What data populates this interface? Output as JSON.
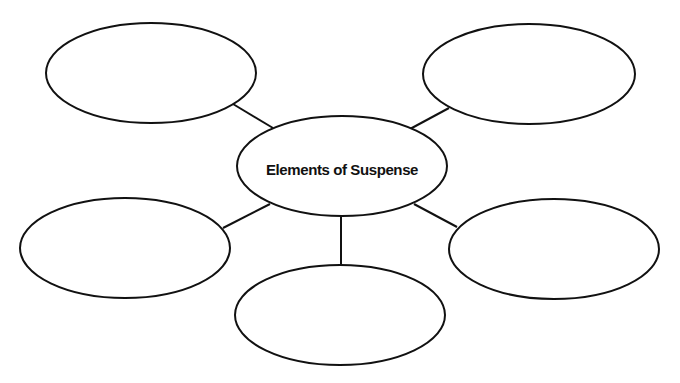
{
  "diagram": {
    "type": "web-organizer",
    "colors": {
      "background": "#ffffff",
      "stroke": "#111111",
      "text": "#111111"
    },
    "center": {
      "label": "Elements of Suspense",
      "cx": 342,
      "cy": 166,
      "rx": 105,
      "ry": 50
    },
    "nodes": [
      {
        "id": "top-left",
        "label": "",
        "cx": 151,
        "cy": 73,
        "rx": 105,
        "ry": 50
      },
      {
        "id": "top-right",
        "label": "",
        "cx": 529,
        "cy": 74,
        "rx": 106,
        "ry": 50
      },
      {
        "id": "middle-left",
        "label": "",
        "cx": 125,
        "cy": 248,
        "rx": 105,
        "ry": 50
      },
      {
        "id": "middle-right",
        "label": "",
        "cx": 554,
        "cy": 249,
        "rx": 105,
        "ry": 50
      },
      {
        "id": "bottom",
        "label": "",
        "cx": 340,
        "cy": 315,
        "rx": 105,
        "ry": 50
      }
    ],
    "connectors": [
      {
        "from": "center",
        "to": "top-left",
        "x1": 273,
        "y1": 128,
        "x2": 233,
        "y2": 104
      },
      {
        "from": "center",
        "to": "top-right",
        "x1": 410,
        "y1": 129,
        "x2": 449,
        "y2": 108
      },
      {
        "from": "center",
        "to": "middle-left",
        "x1": 270,
        "y1": 204,
        "x2": 223,
        "y2": 228
      },
      {
        "from": "center",
        "to": "middle-right",
        "x1": 414,
        "y1": 204,
        "x2": 457,
        "y2": 227
      },
      {
        "from": "center",
        "to": "bottom",
        "x1": 341,
        "y1": 216,
        "x2": 341,
        "y2": 265
      }
    ]
  }
}
